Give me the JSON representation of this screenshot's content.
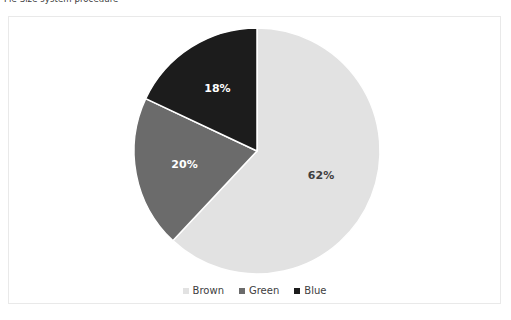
{
  "caption": {
    "text": "Pie Size system procedure"
  },
  "chart_data": {
    "type": "pie",
    "title": "",
    "categories": [
      "Brown",
      "Green",
      "Blue"
    ],
    "values": [
      62,
      20,
      18
    ],
    "value_labels": [
      "62%",
      "20%",
      "18%"
    ],
    "units": "percent",
    "start_angle_deg": 0,
    "direction": "clockwise",
    "colors": [
      "#e2e2e2",
      "#6b6b6b",
      "#1c1c1c"
    ],
    "label_colors": [
      "#404040",
      "#ffffff",
      "#ffffff"
    ],
    "legend": {
      "position": "bottom",
      "entries": [
        {
          "label": "Brown",
          "color": "#e2e2e2"
        },
        {
          "label": "Green",
          "color": "#6b6b6b"
        },
        {
          "label": "Blue",
          "color": "#1c1c1c"
        }
      ]
    },
    "grid": false,
    "xlabel": "",
    "ylabel": ""
  },
  "frame": {
    "border_color": "#e9e9e9",
    "background": "#ffffff"
  }
}
